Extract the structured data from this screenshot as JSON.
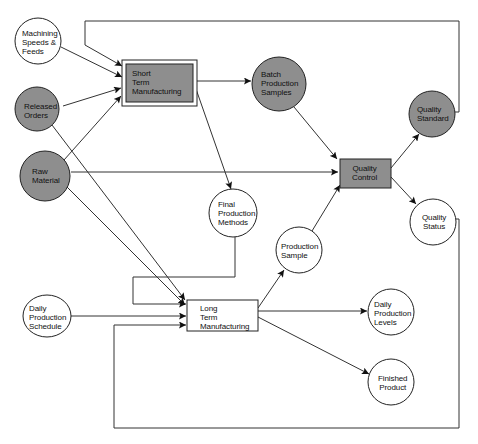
{
  "diagram": {
    "colors": {
      "shaded_fill": "#8e8e8e",
      "stroke": "#222222",
      "background": "#ffffff"
    },
    "nodes": {
      "machining": {
        "label": "Machining\nSpeeds &\nFeeds",
        "shape": "circle",
        "shaded": false
      },
      "released_orders": {
        "label": "Released\nOrders",
        "shape": "circle",
        "shaded": true
      },
      "raw_material": {
        "label": "Raw\nMaterial",
        "shape": "circle",
        "shaded": true
      },
      "short_term": {
        "label": "Short\nTerm\nManufacturing",
        "shape": "double-box",
        "shaded": true
      },
      "batch_samples": {
        "label": "Batch\nProduction\nSamples",
        "shape": "circle",
        "shaded": true
      },
      "quality_control": {
        "label": "Quality\nControl",
        "shape": "box",
        "shaded": true
      },
      "quality_standard": {
        "label": "Quality\nStandard",
        "shape": "circle",
        "shaded": true
      },
      "quality_status": {
        "label": "Quality\nStatus",
        "shape": "circle",
        "shaded": false
      },
      "final_methods": {
        "label": "Final\nProduction\nMethods",
        "shape": "circle",
        "shaded": false
      },
      "production_sample": {
        "label": "Production\nSample",
        "shape": "circle",
        "shaded": false
      },
      "daily_schedule": {
        "label": "Daily\nProduction\nSchedule",
        "shape": "circle",
        "shaded": false
      },
      "long_term": {
        "label": "Long\nTerm\nManufacturing",
        "shape": "box",
        "shaded": false
      },
      "daily_levels": {
        "label": "Daily\nProduction\nLevels",
        "shape": "circle",
        "shaded": false
      },
      "finished_product": {
        "label": "Finished\nProduct",
        "shape": "circle",
        "shaded": false
      }
    },
    "edges": [
      {
        "from": "machining",
        "to": "short_term"
      },
      {
        "from": "released_orders",
        "to": "short_term"
      },
      {
        "from": "raw_material",
        "to": "short_term"
      },
      {
        "from": "quality_standard",
        "to": "short_term",
        "routing": "feedback-top"
      },
      {
        "from": "short_term",
        "to": "batch_samples"
      },
      {
        "from": "short_term",
        "to": "final_methods"
      },
      {
        "from": "batch_samples",
        "to": "quality_control"
      },
      {
        "from": "raw_material",
        "to": "quality_control"
      },
      {
        "from": "production_sample",
        "to": "quality_control"
      },
      {
        "from": "quality_control",
        "to": "quality_standard"
      },
      {
        "from": "quality_control",
        "to": "quality_status"
      },
      {
        "from": "released_orders",
        "to": "long_term"
      },
      {
        "from": "raw_material",
        "to": "long_term"
      },
      {
        "from": "final_methods",
        "to": "long_term",
        "routing": "loop-left"
      },
      {
        "from": "daily_schedule",
        "to": "long_term"
      },
      {
        "from": "quality_status",
        "to": "long_term",
        "routing": "feedback-bottom"
      },
      {
        "from": "long_term",
        "to": "production_sample"
      },
      {
        "from": "long_term",
        "to": "daily_levels"
      },
      {
        "from": "long_term",
        "to": "finished_product"
      }
    ]
  }
}
